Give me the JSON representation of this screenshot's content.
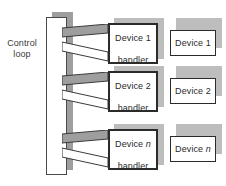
{
  "diagram": {
    "type": "block-diagram",
    "colors": {
      "shadow": "#bdbdbd",
      "bar_shadow": "#9e9e9e",
      "wedge_fill": "#9e9e9e",
      "outline": "#2b2b2b",
      "background": "#ffffff",
      "text": "#2b2b2b"
    },
    "control": {
      "label_line1": "Control",
      "label_line2": "loop"
    },
    "rows": [
      {
        "handler_line1": "Device 1",
        "handler_line2": "handler",
        "device_label": "Device 1",
        "device_index": "1",
        "index_italic": false
      },
      {
        "handler_line1": "Device 2",
        "handler_line2": "handler",
        "device_label": "Device 2",
        "device_index": "2",
        "index_italic": false
      },
      {
        "handler_line1": "Device n",
        "handler_line2": "handler",
        "device_label": "Device n",
        "device_index": "n",
        "index_italic": true
      }
    ]
  }
}
